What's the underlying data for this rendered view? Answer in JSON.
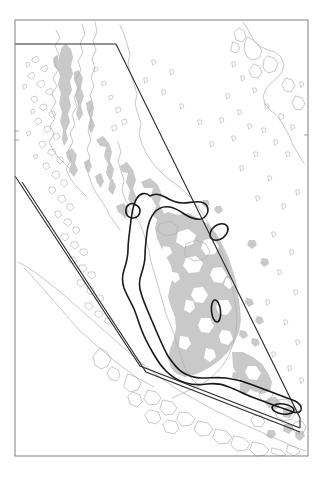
{
  "figure": {
    "kind": "geographic-map",
    "title": "",
    "subtitle": "",
    "caption": "",
    "region_name": "Malay Peninsula and Sunda Shelf",
    "background_color": "#ffffff",
    "frame": {
      "name": "map-frame",
      "stroke_color": "#808080",
      "stroke_width": 1,
      "x": 15,
      "y": 20,
      "width": 293,
      "height": 436
    },
    "axis_ticks": {
      "visible_ticks": 3,
      "tick_color": "#8c8c8c",
      "labels": []
    }
  },
  "legend": {
    "visible": false,
    "entries": [
      {
        "label": "Land / coastline",
        "color": "#b4b4b4",
        "symbol": "thin-line"
      },
      {
        "label": "Shaded terrain",
        "color": "#c9c9c9",
        "symbol": "filled-area"
      },
      {
        "label": "Contour isoline",
        "color": "#1a1a1a",
        "symbol": "thick-line"
      },
      {
        "label": "Study area boundary",
        "color": "#333333",
        "symbol": "polygon-outline"
      }
    ]
  },
  "layers": {
    "coastline": {
      "name": "coastline-layer",
      "stroke_color": "#b0b0b0",
      "stroke_width": 0.7,
      "fill": "none"
    },
    "terrain": {
      "name": "terrain-shading-layer",
      "fill_color": "#c9c9c9",
      "stroke": "none",
      "description": "grey shaded upland / vegetation patches"
    },
    "contour": {
      "name": "contour-isoline-layer",
      "stroke_color": "#1a1a1a",
      "stroke_width": 1.6,
      "fill": "none",
      "closed_loops": 4
    },
    "study_area": {
      "name": "study-area-boundary-layer",
      "stroke_color": "#2b2b2b",
      "stroke_width": 1.1,
      "fill": "none",
      "shape": "parallelogram-swath"
    }
  },
  "chart_data": {
    "type": "map",
    "title": "",
    "xlabel": "",
    "ylabel": "",
    "projection": "equirectangular",
    "grid": false,
    "legend_position": "none",
    "series": [
      {
        "name": "coastline",
        "geometry": "polyline",
        "color": "#b0b0b0"
      },
      {
        "name": "terrain-shading",
        "geometry": "polygon-fill",
        "color": "#c9c9c9"
      },
      {
        "name": "contour-isoline",
        "geometry": "closed-polyline",
        "color": "#1a1a1a"
      },
      {
        "name": "study-area-swath",
        "geometry": "polygon-outline",
        "color": "#2b2b2b"
      }
    ]
  }
}
